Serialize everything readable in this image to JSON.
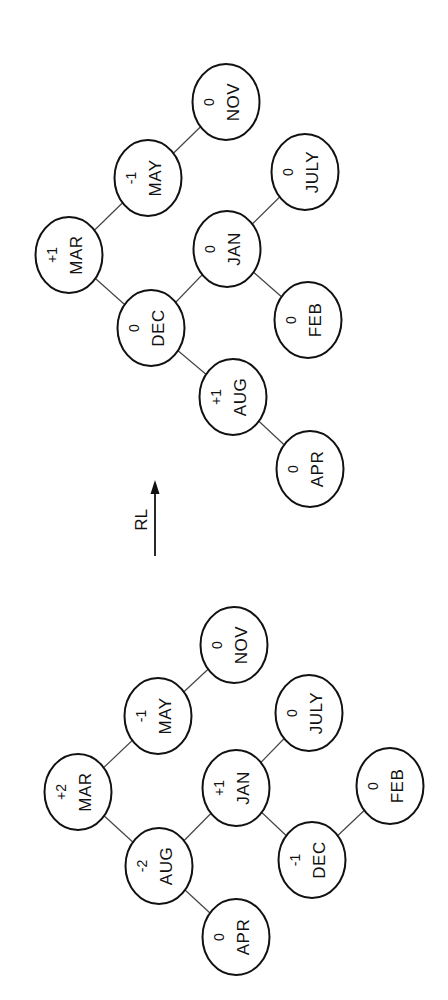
{
  "operation": {
    "label": "RL",
    "arrow_direction": "up"
  },
  "trees": [
    {
      "name": "before-rotation",
      "nodes": [
        {
          "id": "MAR",
          "label": "MAR",
          "balance": "+2",
          "x": 78,
          "y": 792
        },
        {
          "id": "MAY",
          "label": "MAY",
          "balance": "-1",
          "x": 158,
          "y": 716
        },
        {
          "id": "NOV",
          "label": "NOV",
          "balance": "0",
          "x": 234,
          "y": 645
        },
        {
          "id": "AUG",
          "label": "AUG",
          "balance": "-2",
          "x": 159,
          "y": 866
        },
        {
          "id": "JAN",
          "label": "JAN",
          "balance": "+1",
          "x": 236,
          "y": 788
        },
        {
          "id": "JULY",
          "label": "JULY",
          "balance": "0",
          "x": 309,
          "y": 713
        },
        {
          "id": "APR",
          "label": "APR",
          "balance": "0",
          "x": 236,
          "y": 937
        },
        {
          "id": "DEC",
          "label": "DEC",
          "balance": "-1",
          "x": 312,
          "y": 860
        },
        {
          "id": "FEB",
          "label": "FEB",
          "balance": "0",
          "x": 390,
          "y": 786
        }
      ],
      "edges": [
        [
          "MAR",
          "MAY"
        ],
        [
          "MAY",
          "NOV"
        ],
        [
          "MAR",
          "AUG"
        ],
        [
          "AUG",
          "JAN"
        ],
        [
          "JAN",
          "JULY"
        ],
        [
          "AUG",
          "APR"
        ],
        [
          "JAN",
          "DEC"
        ],
        [
          "DEC",
          "FEB"
        ]
      ]
    },
    {
      "name": "after-rotation",
      "nodes": [
        {
          "id": "MAR",
          "label": "MAR",
          "balance": "+1",
          "x": 69,
          "y": 255
        },
        {
          "id": "MAY",
          "label": "MAY",
          "balance": "-1",
          "x": 148,
          "y": 178
        },
        {
          "id": "NOV",
          "label": "NOV",
          "balance": "0",
          "x": 226,
          "y": 102
        },
        {
          "id": "DEC",
          "label": "DEC",
          "balance": "0",
          "x": 151,
          "y": 328
        },
        {
          "id": "JAN",
          "label": "JAN",
          "balance": "0",
          "x": 227,
          "y": 249
        },
        {
          "id": "JULY",
          "label": "JULY",
          "balance": "0",
          "x": 305,
          "y": 172
        },
        {
          "id": "FEB",
          "label": "FEB",
          "balance": "0",
          "x": 308,
          "y": 320
        },
        {
          "id": "AUG",
          "label": "AUG",
          "balance": "+1",
          "x": 233,
          "y": 397
        },
        {
          "id": "APR",
          "label": "APR",
          "balance": "0",
          "x": 310,
          "y": 469
        }
      ],
      "edges": [
        [
          "MAR",
          "MAY"
        ],
        [
          "MAY",
          "NOV"
        ],
        [
          "MAR",
          "DEC"
        ],
        [
          "DEC",
          "JAN"
        ],
        [
          "JAN",
          "JULY"
        ],
        [
          "JAN",
          "FEB"
        ],
        [
          "DEC",
          "AUG"
        ],
        [
          "AUG",
          "APR"
        ]
      ]
    }
  ]
}
